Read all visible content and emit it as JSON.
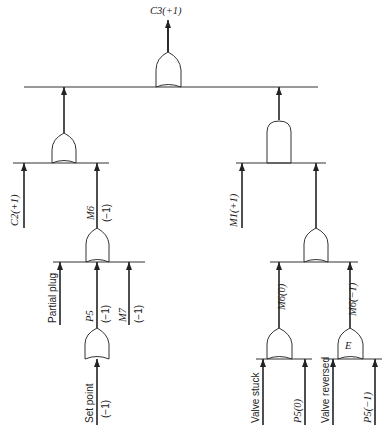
{
  "diagram": {
    "type": "fault-tree",
    "top_event": "C3(+1)",
    "gates": [
      {
        "id": "g_top",
        "kind": "OR",
        "output": "C3(+1)"
      },
      {
        "id": "g_left",
        "kind": "OR",
        "output": "to top"
      },
      {
        "id": "g_right",
        "kind": "AND",
        "output": "to top"
      },
      {
        "id": "g_m6",
        "kind": "OR",
        "output": "M6(-1)"
      },
      {
        "id": "g_p5",
        "kind": "OR",
        "output": "P5(-1)"
      },
      {
        "id": "g_rmid",
        "kind": "OR",
        "output": "to right AND"
      },
      {
        "id": "g_m6zero",
        "kind": "OR",
        "output": "M6(0)"
      },
      {
        "id": "g_excl",
        "kind": "OR",
        "label": "E",
        "output": "M6(-1)"
      }
    ],
    "labels": {
      "top": "C3(+1)",
      "c2": "C2(+1)",
      "m6_name": "M6",
      "m6_val": "(−1)",
      "m1": "M1(+1)",
      "partial_plug": "Partial plug",
      "p5_name": "P5",
      "p5_val": "(−1)",
      "m7_name": "M7",
      "m7_val": "(−1)",
      "set_point": "Set point",
      "set_point_val": "(−1)",
      "m6_zero": "M6(0)",
      "m6_neg": "M6(−1)",
      "e_gate": "E",
      "valve_stuck": "Valve stuck",
      "p5_zero": "P5(0)",
      "valve_reversed": "Valve reversed",
      "p5_neg": "P5(−1)"
    }
  }
}
